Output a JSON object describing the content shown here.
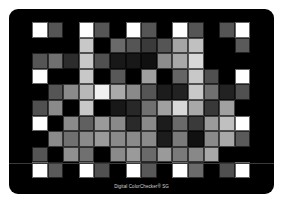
{
  "card": {
    "label": "Digital ColorChecker® SG",
    "background": "#000000"
  },
  "grid": {
    "columns": 14,
    "rows": 10,
    "patches": [
      [
        "#ffffff",
        "#555555",
        "#000000",
        "#ffffff",
        "#555555",
        "#000000",
        "#ffffff",
        "#555555",
        "#000000",
        "#ffffff",
        "#555555",
        "#000000",
        "#555555",
        "#ffffff"
      ],
      [
        "#000000",
        "#000000",
        "#000000",
        "#c8c8c8",
        "#000000",
        "#6a6a6a",
        "#555555",
        "#3a3a3a",
        "#555555",
        "#a5a5a5",
        "#c0c0c0",
        "#000000",
        "#000000",
        "#5a5a5a"
      ],
      [
        "#555555",
        "#707070",
        "#2c2c2c",
        "#c8c8c8",
        "#505050",
        "#181818",
        "#181818",
        "#101010",
        "#8c8c8c",
        "#a8a8a8",
        "#d8d8d8",
        "#000000",
        "#000000",
        "#000000"
      ],
      [
        "#ffffff",
        "#000000",
        "#000000",
        "#c8c8c8",
        "#000000",
        "#585858",
        "#000000",
        "#a0a0a0",
        "#000000",
        "#646464",
        "#c8c8c8",
        "#505050",
        "#000000",
        "#ffffff"
      ],
      [
        "#000000",
        "#555555",
        "#8a8a8a",
        "#b8b8b8",
        "#f0f0f0",
        "#aaaaaa",
        "#8a8a8a",
        "#555555",
        "#1c1c1c",
        "#222222",
        "#c8c8c8",
        "#707070",
        "#222222",
        "#505050"
      ],
      [
        "#505050",
        "#8a8a8a",
        "#000000",
        "#c8c8c8",
        "#000000",
        "#181818",
        "#282828",
        "#707070",
        "#a0a0a0",
        "#d8d8d8",
        "#a8a8a8",
        "#383838",
        "#a0a0a0",
        "#000000"
      ],
      [
        "#ffffff",
        "#000000",
        "#8a8a8a",
        "#606060",
        "#9a9a9a",
        "#8a8a8a",
        "#2a2a2a",
        "#8a8a8a",
        "#1c1c1c",
        "#6a6a6a",
        "#3a3a3a",
        "#9a9a9a",
        "#c0c0c0",
        "#ffffff"
      ],
      [
        "#000000",
        "#8a8a8a",
        "#707070",
        "#8a8a8a",
        "#9a9a9a",
        "#8a8a8a",
        "#8a8a8a",
        "#8a8a8a",
        "#1c1c1c",
        "#7a7a7a",
        "#111111",
        "#8a8a8a",
        "#a8a8a8",
        "#5a5a5a"
      ],
      [
        "#555555",
        "#000000",
        "#909090",
        "#707070",
        "#000000",
        "#8a8a8a",
        "#9a9a9a",
        "#6a6a6a",
        "#9a9a9a",
        "#7a7a7a",
        "#888888",
        "#a8a8a8",
        "#000000",
        "#000000"
      ],
      [
        "#ffffff",
        "#5a5a5a",
        "#000000",
        "#ffffff",
        "#505050",
        "#000000",
        "#ffffff",
        "#585858",
        "#000000",
        "#ffffff",
        "#6a6a6a",
        "#000000",
        "#505050",
        "#ffffff"
      ]
    ]
  }
}
